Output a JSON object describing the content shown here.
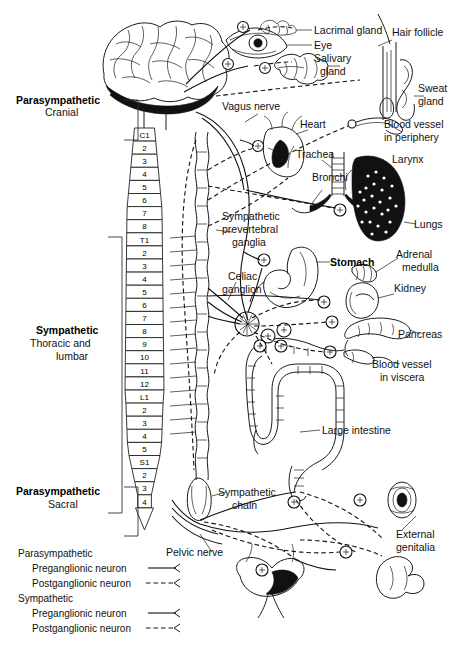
{
  "diagram": {
    "type": "anatomical-schematic",
    "background": "#ffffff",
    "ink_color": "#111111"
  },
  "divisions": [
    {
      "id": "parasympathetic-cranial",
      "name": "Parasympathetic",
      "sub": "Cranial"
    },
    {
      "id": "sympathetic-thoracolumbar",
      "name": "Sympathetic",
      "sub_line1": "Thoracic and",
      "sub_line2": "lumbar"
    },
    {
      "id": "parasympathetic-sacral",
      "name": "Parasympathetic",
      "sub": "Sacral"
    }
  ],
  "spinal_segments": {
    "cervical": [
      "C1",
      "2",
      "3",
      "4",
      "5",
      "6",
      "7",
      "8"
    ],
    "thoracic": [
      "T1",
      "2",
      "3",
      "4",
      "5",
      "6",
      "7",
      "8",
      "9",
      "10",
      "11",
      "12"
    ],
    "lumbar": [
      "L1",
      "2",
      "3",
      "4",
      "5"
    ],
    "sacral": [
      "S1",
      "2",
      "3",
      "4"
    ]
  },
  "organ_labels": [
    {
      "id": "lacrimal-gland",
      "text": "Lacrimal gland"
    },
    {
      "id": "eye",
      "text": "Eye"
    },
    {
      "id": "salivary-gland",
      "line1": "Salivary",
      "line2": "gland"
    },
    {
      "id": "hair-follicle",
      "text": "Hair follicle"
    },
    {
      "id": "sweat-gland",
      "line1": "Sweat",
      "line2": "gland"
    },
    {
      "id": "blood-vessel-periphery",
      "line1": "Blood vessel",
      "line2": "in periphery"
    },
    {
      "id": "vagus-nerve",
      "text": "Vagus nerve"
    },
    {
      "id": "heart",
      "text": "Heart"
    },
    {
      "id": "trachea",
      "text": "Trachea"
    },
    {
      "id": "bronchi",
      "text": "Bronchi"
    },
    {
      "id": "larynx",
      "text": "Larynx"
    },
    {
      "id": "lungs",
      "text": "Lungs"
    },
    {
      "id": "stomach",
      "text": "Stomach"
    },
    {
      "id": "adrenal-medulla",
      "line1": "Adrenal",
      "line2": "medulla"
    },
    {
      "id": "kidney",
      "text": "Kidney"
    },
    {
      "id": "pancreas",
      "text": "Pancreas"
    },
    {
      "id": "blood-vessel-viscera",
      "line1": "Blood vessel",
      "line2": "in viscera"
    },
    {
      "id": "large-intestine",
      "text": "Large intestine"
    },
    {
      "id": "external-genitalia",
      "line1": "External",
      "line2": "genitalia"
    },
    {
      "id": "pelvic-nerve",
      "text": "Pelvic nerve"
    }
  ],
  "structure_labels": [
    {
      "id": "sympathetic-prevertebral-ganglia",
      "line1": "Sympathetic",
      "line2": "prevertebral",
      "line3": "ganglia"
    },
    {
      "id": "celiac-ganglion",
      "line1": "Celiac",
      "line2": "ganglion"
    },
    {
      "id": "sympathetic-chain",
      "line1": "Sympathetic",
      "line2": "chain"
    }
  ],
  "legend": {
    "groups": [
      {
        "heading": "Parasympathetic",
        "entries": [
          {
            "label": "Preganglionic neuron",
            "style": "solid"
          },
          {
            "label": "Postganglionic neuron",
            "style": "dashed"
          }
        ]
      },
      {
        "heading": "Sympathetic",
        "entries": [
          {
            "label": "Preganglionic neuron",
            "style": "solid"
          },
          {
            "label": "Postganglionic neuron",
            "style": "dashed"
          }
        ]
      }
    ]
  }
}
